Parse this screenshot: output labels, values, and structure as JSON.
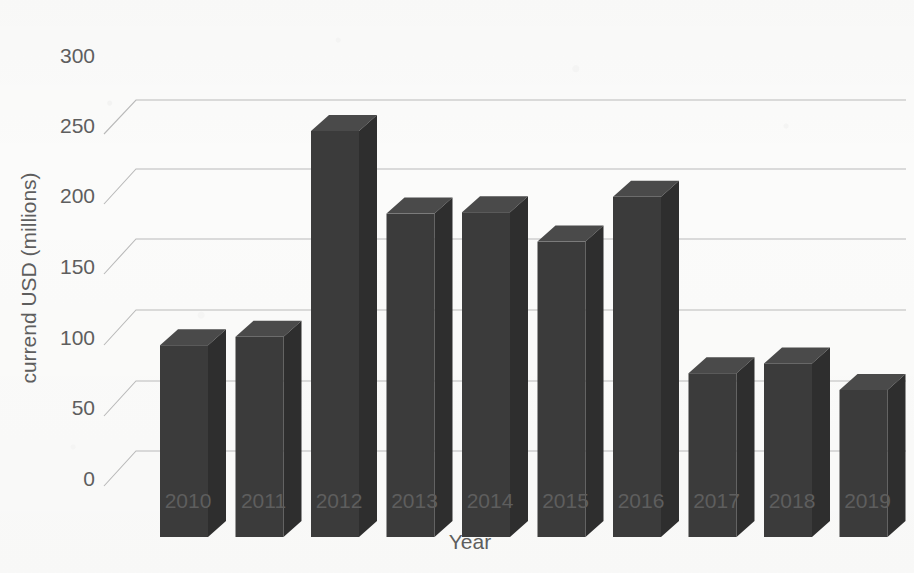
{
  "chart_data": {
    "type": "bar",
    "title": "",
    "subtitle": "",
    "xlabel": "Year",
    "ylabel": "currend USD (millions)",
    "categories": [
      "2010",
      "2011",
      "2012",
      "2013",
      "2014",
      "2015",
      "2016",
      "2017",
      "2018",
      "2019"
    ],
    "values": [
      137,
      143,
      290,
      231,
      232,
      211,
      243,
      117,
      124,
      105
    ],
    "ytick_labels": [
      "0",
      "50",
      "100",
      "150",
      "200",
      "250",
      "300"
    ],
    "yticks": [
      0,
      50,
      100,
      150,
      200,
      250,
      300
    ],
    "ylim": [
      0,
      300
    ],
    "grid": true,
    "grid_axis": "y",
    "legend": false,
    "legend_position": "none",
    "style": "3d-column",
    "bar_color": "#3b3b3b",
    "bar_top_color": "#4a4a4a",
    "bar_side_color": "#2e2e2e",
    "grid_color": "#b9b9b9",
    "text_color": "#5e5e5e",
    "background_color": "#fbfbfa"
  }
}
